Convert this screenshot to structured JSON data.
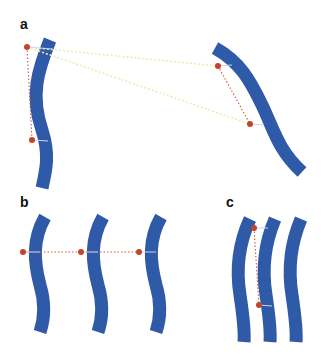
{
  "figure": {
    "background": "#ffffff",
    "colors": {
      "strand": "#2f5aa8",
      "strand_dark": "#2a4a92",
      "point": "#c5432c",
      "point_link": "#d35a3a",
      "cross_link": "#e9edb0",
      "tick": "#c9d6ea"
    },
    "panels": [
      {
        "label": "a",
        "label_pos": [
          20,
          27
        ],
        "strands": [
          {
            "path": "M50,40 C38,70 30,95 42,130 C50,155 46,170 42,188"
          },
          {
            "path": "M215,48 C240,62 250,80 262,105 C274,130 278,150 302,172"
          }
        ],
        "points": [
          {
            "x": 27,
            "y": 47,
            "tick_to": [
              52,
              49
            ]
          },
          {
            "x": 32,
            "y": 140,
            "tick_to": [
              48,
              141
            ]
          },
          {
            "x": 218,
            "y": 66,
            "tick_to": [
              232,
              65
            ]
          },
          {
            "x": 250,
            "y": 124,
            "tick_to": [
              264,
              125
            ]
          }
        ],
        "links": [
          {
            "from": [
              27,
              47
            ],
            "to": [
              32,
              140
            ],
            "style": "point_link"
          },
          {
            "from": [
              218,
              66
            ],
            "to": [
              250,
              124
            ],
            "style": "point_link"
          },
          {
            "from": [
              27,
              47
            ],
            "to": [
              218,
              66
            ],
            "style": "cross_link"
          },
          {
            "from": [
              27,
              47
            ],
            "to": [
              250,
              124
            ],
            "style": "cross_link"
          }
        ]
      },
      {
        "label": "b",
        "label_pos": [
          20,
          205
        ],
        "strands": [
          {
            "path": "M45,217 C32,240 34,262 40,285 C46,305 44,320 40,332"
          },
          {
            "path": "M103,217 C90,240 92,262 98,285 C104,305 102,320 98,332"
          },
          {
            "path": "M161,217 C148,240 150,262 156,285 C162,305 160,320 156,332"
          }
        ],
        "points": [
          {
            "x": 23,
            "y": 252,
            "tick_to": [
              40,
              252
            ]
          },
          {
            "x": 81,
            "y": 252,
            "tick_to": [
              98,
              252
            ]
          },
          {
            "x": 139,
            "y": 252,
            "tick_to": [
              156,
              252
            ]
          }
        ],
        "links": [
          {
            "from": [
              23,
              252
            ],
            "to": [
              139,
              252
            ],
            "style": "point_link"
          }
        ]
      },
      {
        "label": "c",
        "label_pos": [
          226,
          205
        ],
        "strands": [
          {
            "path": "M250,219 C238,245 236,270 240,295 C243,315 245,330 244,342"
          },
          {
            "path": "M275,219 C264,245 262,270 266,295 C269,315 271,330 270,342"
          },
          {
            "path": "M301,219 C290,245 288,270 292,295 C295,315 297,330 296,342"
          }
        ],
        "points": [
          {
            "x": 254,
            "y": 228,
            "tick_to": [
              268,
              228
            ]
          },
          {
            "x": 259,
            "y": 305,
            "tick_to": [
              272,
              306
            ]
          }
        ],
        "links": [
          {
            "from": [
              254,
              228
            ],
            "to": [
              259,
              305
            ],
            "style": "point_link"
          }
        ]
      }
    ]
  }
}
